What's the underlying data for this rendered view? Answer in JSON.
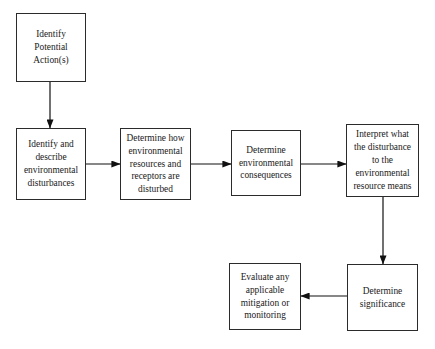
{
  "diagram": {
    "background_color": "#ffffff",
    "border_color": "#2b2b2b",
    "text_color": "#1a1a1a",
    "nodes": [
      {
        "id": "identify-potential-actions",
        "label": "Identify\nPotential\nAction(s)",
        "x": 16,
        "y": 13,
        "w": 70,
        "h": 69
      },
      {
        "id": "identify-describe-disturbances",
        "label": "Identify and\ndescribe\nenvironmental\ndisturbances",
        "x": 16,
        "y": 128,
        "w": 70,
        "h": 72
      },
      {
        "id": "determine-how-disturbed",
        "label": "Determine how\nenvironmental\nresources and\nreceptors are\ndisturbed",
        "x": 120,
        "y": 128,
        "w": 71,
        "h": 72
      },
      {
        "id": "determine-environmental-consequences",
        "label": "Determine\nenvironmental\nconsequences",
        "x": 231,
        "y": 130,
        "w": 70,
        "h": 66
      },
      {
        "id": "interpret-disturbance-meaning",
        "label": "Interpret what\nthe disturbance\nto the\nenvironmental\nresource means",
        "x": 346,
        "y": 124,
        "w": 73,
        "h": 73
      },
      {
        "id": "determine-significance",
        "label": "Determine\nsignificance",
        "x": 347,
        "y": 264,
        "w": 71,
        "h": 67
      },
      {
        "id": "evaluate-mitigation-monitoring",
        "label": "Evaluate any\napplicable\nmitigation or\nmonitoring",
        "x": 229,
        "y": 263,
        "w": 72,
        "h": 67
      }
    ],
    "connectors": [
      {
        "id": "actions-to-disturbances",
        "from": "identify-potential-actions",
        "to": "identify-describe-disturbances",
        "direction": "down",
        "x1": 50,
        "y1": 82,
        "x2": 50,
        "y2": 128
      },
      {
        "id": "disturbances-to-how-disturbed",
        "from": "identify-describe-disturbances",
        "to": "determine-how-disturbed",
        "direction": "right",
        "x1": 86,
        "y1": 164,
        "x2": 120,
        "y2": 164
      },
      {
        "id": "how-disturbed-to-consequences",
        "from": "determine-how-disturbed",
        "to": "determine-environmental-consequences",
        "direction": "right",
        "x1": 191,
        "y1": 164,
        "x2": 231,
        "y2": 164
      },
      {
        "id": "consequences-to-interpret",
        "from": "determine-environmental-consequences",
        "to": "interpret-disturbance-meaning",
        "direction": "right",
        "x1": 301,
        "y1": 164,
        "x2": 346,
        "y2": 164
      },
      {
        "id": "interpret-to-significance",
        "from": "interpret-disturbance-meaning",
        "to": "determine-significance",
        "direction": "down",
        "x1": 383,
        "y1": 197,
        "x2": 383,
        "y2": 264
      },
      {
        "id": "significance-to-evaluate",
        "from": "determine-significance",
        "to": "evaluate-mitigation-monitoring",
        "direction": "left",
        "x1": 347,
        "y1": 296,
        "x2": 301,
        "y2": 296
      }
    ]
  }
}
